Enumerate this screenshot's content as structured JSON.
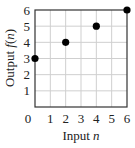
{
  "chart_data": {
    "type": "scatter",
    "title": "",
    "xlabel": "Input n",
    "ylabel": "Output f(n)",
    "xlabel_parts": {
      "text": "Input ",
      "var": "n"
    },
    "ylabel_parts": {
      "text": "Output ",
      "fn": "f",
      "open": "(",
      "var": "n",
      "close": ")"
    },
    "x": [
      0,
      2,
      4,
      6
    ],
    "y": [
      3,
      4,
      5,
      6
    ],
    "points": [
      {
        "x": 0,
        "y": 3
      },
      {
        "x": 2,
        "y": 4
      },
      {
        "x": 4,
        "y": 5
      },
      {
        "x": 6,
        "y": 6
      }
    ],
    "xlim": [
      0,
      6
    ],
    "ylim": [
      0,
      6
    ],
    "xticks": [
      0,
      1,
      2,
      3,
      4,
      5,
      6
    ],
    "yticks": [
      1,
      2,
      3,
      4,
      5,
      6
    ],
    "grid": true,
    "legend": null
  },
  "colors": {
    "grid": "#cfcfcf",
    "frame": "#333333",
    "point": "#000000",
    "text": "#222222"
  }
}
